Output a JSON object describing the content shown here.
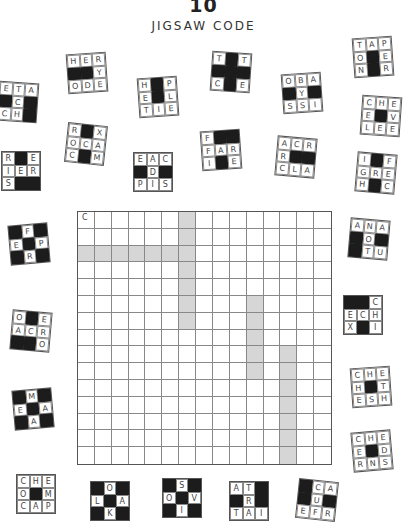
{
  "header": {
    "number": "10",
    "title": "JIGSAW CODE"
  },
  "colors": {
    "shade": "#d6d6d6",
    "black": "#1c1c1c",
    "line": "#888888"
  },
  "grid": {
    "rows": 15,
    "cols": 15,
    "given": [
      {
        "row": 0,
        "col": 0,
        "letter": "C"
      }
    ],
    "shaded_cells": [
      [
        0,
        6
      ],
      [
        1,
        6
      ],
      [
        2,
        0
      ],
      [
        2,
        1
      ],
      [
        2,
        2
      ],
      [
        2,
        3
      ],
      [
        2,
        4
      ],
      [
        2,
        5
      ],
      [
        2,
        6
      ],
      [
        3,
        6
      ],
      [
        4,
        6
      ],
      [
        5,
        6
      ],
      [
        6,
        6
      ],
      [
        5,
        10
      ],
      [
        6,
        10
      ],
      [
        7,
        10
      ],
      [
        8,
        10
      ],
      [
        9,
        10
      ],
      [
        8,
        12
      ],
      [
        9,
        12
      ],
      [
        10,
        12
      ],
      [
        11,
        12
      ],
      [
        12,
        12
      ],
      [
        13,
        12
      ],
      [
        14,
        12
      ]
    ]
  },
  "pieces": [
    {
      "id": "p1",
      "x": 67,
      "y": 53,
      "rot": -4,
      "cells": [
        "H",
        "E",
        "R",
        "#",
        "#",
        "Y",
        "O",
        "D",
        "E"
      ]
    },
    {
      "id": "p2",
      "x": 138,
      "y": 77,
      "rot": -4,
      "cells": [
        "H",
        "#",
        "P",
        "E",
        "#",
        "L",
        "T",
        "I",
        "E"
      ]
    },
    {
      "id": "p3",
      "x": 211,
      "y": 52,
      "rot": 4,
      "cells": [
        "T",
        "#",
        "T",
        "#",
        "#",
        "#",
        "C",
        "#",
        "E"
      ]
    },
    {
      "id": "p4",
      "x": 282,
      "y": 73,
      "rot": -4,
      "cells": [
        "O",
        "B",
        "A",
        "#",
        "Y",
        "#",
        "S",
        "S",
        "I"
      ]
    },
    {
      "id": "p5",
      "x": 353,
      "y": 37,
      "rot": -4,
      "cells": [
        "T",
        "A",
        "P",
        "O",
        "#",
        "E",
        "N",
        "#",
        "R"
      ]
    },
    {
      "id": "p6",
      "x": -2,
      "y": 82,
      "rot": 4,
      "cells": [
        "E",
        "T",
        "A",
        "#",
        "C",
        "#",
        "C",
        "H",
        "#"
      ]
    },
    {
      "id": "p7",
      "x": 66,
      "y": 124,
      "rot": 6,
      "cells": [
        "R",
        "#",
        "X",
        "O",
        "C",
        "A",
        "C",
        "#",
        "M"
      ]
    },
    {
      "id": "p8",
      "x": 133,
      "y": 152,
      "rot": 0,
      "cells": [
        "E",
        "A",
        "C",
        "#",
        "D",
        "#",
        "P",
        "I",
        "S"
      ]
    },
    {
      "id": "p9",
      "x": 201,
      "y": 130,
      "rot": -4,
      "cells": [
        "F",
        "#",
        "#",
        "F",
        "A",
        "R",
        "I",
        "#",
        "E"
      ]
    },
    {
      "id": "p10",
      "x": 276,
      "y": 137,
      "rot": 5,
      "cells": [
        "A",
        "C",
        "R",
        "R",
        "#",
        "#",
        "C",
        "L",
        "A"
      ]
    },
    {
      "id": "p11",
      "x": 361,
      "y": 96,
      "rot": 4,
      "cells": [
        "C",
        "H",
        "E",
        "E",
        "#",
        "V",
        "L",
        "E",
        "E"
      ]
    },
    {
      "id": "p12",
      "x": 356,
      "y": 153,
      "rot": 5,
      "cells": [
        "I",
        "#",
        "F",
        "G",
        "R",
        "E",
        "H",
        "#",
        "C"
      ]
    },
    {
      "id": "p13",
      "x": 1,
      "y": 151,
      "rot": 0,
      "cells": [
        "R",
        "#",
        "E",
        "I",
        "E",
        "R",
        "S",
        "#",
        "#"
      ]
    },
    {
      "id": "p14",
      "x": 9,
      "y": 224,
      "rot": -5,
      "cells": [
        "#",
        "F",
        "#",
        "E",
        "#",
        "P",
        "#",
        "R",
        "#"
      ]
    },
    {
      "id": "p15",
      "x": 349,
      "y": 219,
      "rot": 5,
      "cells": [
        "A",
        "N",
        "A",
        "#",
        "O",
        "#",
        "#",
        "T",
        "U"
      ]
    },
    {
      "id": "p16",
      "x": 11,
      "y": 311,
      "rot": 5,
      "cells": [
        "O",
        "#",
        "E",
        "A",
        "C",
        "R",
        "#",
        "#",
        "O"
      ]
    },
    {
      "id": "p17",
      "x": 343,
      "y": 295,
      "rot": 0,
      "cells": [
        "#",
        "#",
        "C",
        "E",
        "C",
        "H",
        "X",
        "#",
        "I"
      ]
    },
    {
      "id": "p18",
      "x": 13,
      "y": 389,
      "rot": -5,
      "cells": [
        "#",
        "M",
        "#",
        "E",
        "#",
        "A",
        "#",
        "A",
        "#"
      ]
    },
    {
      "id": "p19",
      "x": 351,
      "y": 367,
      "rot": -4,
      "cells": [
        "C",
        "H",
        "E",
        "H",
        "#",
        "T",
        "E",
        "S",
        "H"
      ]
    },
    {
      "id": "p20",
      "x": 352,
      "y": 431,
      "rot": -5,
      "cells": [
        "C",
        "H",
        "E",
        "E",
        "#",
        "D",
        "R",
        "N",
        "S"
      ]
    },
    {
      "id": "p21",
      "x": 16,
      "y": 474,
      "rot": 0,
      "cells": [
        "C",
        "H",
        "E",
        "O",
        "#",
        "M",
        "C",
        "A",
        "P"
      ]
    },
    {
      "id": "p22",
      "x": 90,
      "y": 481,
      "rot": 0,
      "cells": [
        "#",
        "O",
        "#",
        "L",
        "#",
        "A",
        "#",
        "K",
        "#"
      ]
    },
    {
      "id": "p23",
      "x": 162,
      "y": 478,
      "rot": 0,
      "cells": [
        "#",
        "S",
        "#",
        "O",
        "#",
        "V",
        "#",
        "I",
        "#"
      ]
    },
    {
      "id": "p24",
      "x": 229,
      "y": 481,
      "rot": 0,
      "cells": [
        "A",
        "T",
        "#",
        "#",
        "R",
        "#",
        "T",
        "A",
        "I"
      ]
    },
    {
      "id": "p25",
      "x": 297,
      "y": 480,
      "rot": 6,
      "cells": [
        "#",
        "C",
        "A",
        "#",
        "U",
        "#",
        "E",
        "F",
        "R"
      ]
    }
  ]
}
